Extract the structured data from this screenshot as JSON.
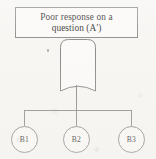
{
  "diagram": {
    "type": "cause-and-effect-tree",
    "root": {
      "label_line_1": "Poor response on a",
      "label_line_2": "question (A')",
      "full_label": "Poor response on a question (A')",
      "shape": "rectangle"
    },
    "connector_node": {
      "shape": "rounded-top-curved-bottom",
      "label": ""
    },
    "effects": [
      {
        "label": "B1",
        "shape": "circle"
      },
      {
        "label": "B2",
        "shape": "circle"
      },
      {
        "label": "B3",
        "shape": "circle"
      }
    ]
  },
  "colors": {
    "background": "#f7f6f3",
    "stroke": "#8d8d8d",
    "connector_stroke": "#8f8f8f",
    "text": "#2f2f2f",
    "node_fill": "#fbfaf8"
  }
}
